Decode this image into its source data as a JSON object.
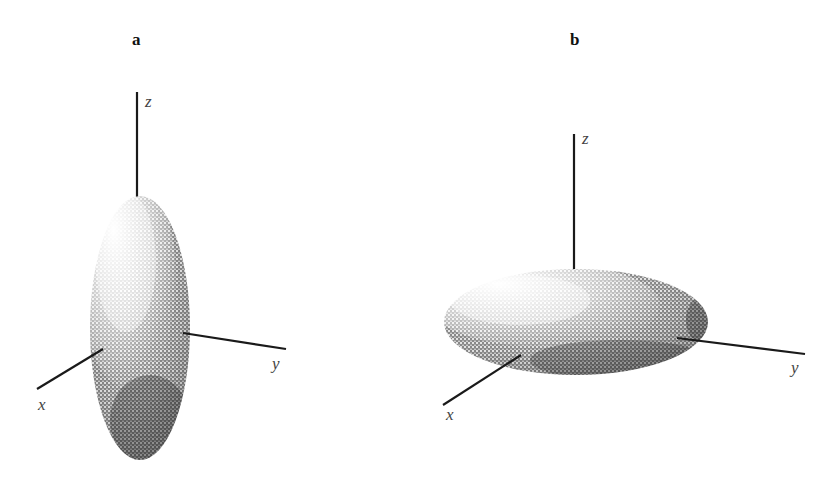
{
  "figure": {
    "panels": [
      {
        "id": "a",
        "label": "a",
        "shape": "prolate spheroid (elongated along z)",
        "axes": {
          "x": "x",
          "y": "y",
          "z": "z"
        }
      },
      {
        "id": "b",
        "label": "b",
        "shape": "oblate spheroid (flattened along z)",
        "axes": {
          "x": "x",
          "y": "y",
          "z": "z"
        }
      }
    ]
  },
  "colors": {
    "ink": "#1a1a1a",
    "axis_label": "#444444",
    "background": "#ffffff"
  }
}
